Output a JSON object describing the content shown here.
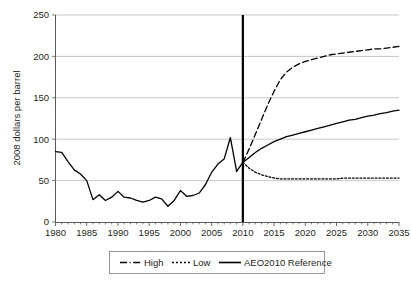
{
  "chart_data": {
    "type": "line",
    "title": "",
    "xlabel": "",
    "ylabel": "2008 dollars per barrel",
    "xlim": [
      1980,
      2035
    ],
    "ylim": [
      0,
      250
    ],
    "grid": true,
    "legend_position": "bottom",
    "y_ticks": [
      0,
      50,
      100,
      150,
      200,
      250
    ],
    "x_ticks": [
      1980,
      1985,
      1990,
      1995,
      2000,
      2005,
      2010,
      2015,
      2020,
      2025,
      2030,
      2035
    ],
    "x_tick_labels": [
      "1980",
      "1985",
      "1990",
      "1995",
      "2000",
      "2005",
      "2010",
      "2015",
      "2020",
      "2025",
      "2030",
      "2035"
    ],
    "y_tick_labels": [
      "0",
      "50",
      "100",
      "150",
      "200",
      "250"
    ],
    "x_minor_tick_interval": 1,
    "annotations": [
      {
        "name": "history-projection-divider",
        "type": "vertical-line",
        "x": 2010,
        "style": "solid-thick-black"
      }
    ],
    "series": [
      {
        "name": "History",
        "style": "solid",
        "color": "#000000",
        "x": [
          1980,
          1981,
          1982,
          1983,
          1984,
          1985,
          1986,
          1987,
          1988,
          1989,
          1990,
          1991,
          1992,
          1993,
          1994,
          1995,
          1996,
          1997,
          1998,
          1999,
          2000,
          2001,
          2002,
          2003,
          2004,
          2005,
          2006,
          2007,
          2008,
          2009,
          2010
        ],
        "values": [
          85,
          84,
          73,
          63,
          58,
          50,
          27,
          33,
          26,
          30,
          37,
          30,
          29,
          26,
          24,
          26,
          30,
          28,
          19,
          26,
          38,
          31,
          32,
          35,
          45,
          60,
          70,
          76,
          102,
          61,
          72
        ]
      },
      {
        "name": "High",
        "style": "dashed",
        "color": "#000000",
        "x": [
          2010,
          2011,
          2012,
          2013,
          2014,
          2015,
          2016,
          2017,
          2018,
          2019,
          2020,
          2021,
          2022,
          2023,
          2024,
          2025,
          2026,
          2027,
          2028,
          2029,
          2030,
          2031,
          2032,
          2033,
          2034,
          2035
        ],
        "values": [
          72,
          88,
          106,
          124,
          142,
          158,
          172,
          181,
          187,
          191,
          194,
          196,
          198,
          200,
          202,
          203,
          204,
          205,
          206,
          207,
          208,
          209,
          209,
          210,
          211,
          212
        ]
      },
      {
        "name": "Low",
        "style": "dotted",
        "color": "#000000",
        "x": [
          2010,
          2011,
          2012,
          2013,
          2014,
          2015,
          2016,
          2017,
          2018,
          2019,
          2020,
          2021,
          2022,
          2023,
          2024,
          2025,
          2026,
          2027,
          2028,
          2029,
          2030,
          2031,
          2032,
          2033,
          2034,
          2035
        ],
        "values": [
          72,
          65,
          60,
          57,
          55,
          53,
          52,
          52,
          52,
          52,
          52,
          52,
          52,
          52,
          52,
          52,
          53,
          53,
          53,
          53,
          53,
          53,
          53,
          53,
          53,
          53
        ]
      },
      {
        "name": "AEO2010 Reference",
        "style": "solid",
        "color": "#000000",
        "x": [
          2010,
          2011,
          2012,
          2013,
          2014,
          2015,
          2016,
          2017,
          2018,
          2019,
          2020,
          2021,
          2022,
          2023,
          2024,
          2025,
          2026,
          2027,
          2028,
          2029,
          2030,
          2031,
          2032,
          2033,
          2034,
          2035
        ],
        "values": [
          72,
          78,
          84,
          89,
          93,
          97,
          100,
          103,
          105,
          107,
          109,
          111,
          113,
          115,
          117,
          119,
          121,
          123,
          124,
          126,
          128,
          129,
          131,
          132,
          134,
          135
        ]
      }
    ],
    "legend": [
      {
        "label": "High",
        "style": "dash-dot",
        "color": "#000000"
      },
      {
        "label": "Low",
        "style": "dotted",
        "color": "#000000"
      },
      {
        "label": "AEO2010 Reference",
        "style": "solid",
        "color": "#000000"
      }
    ]
  },
  "colors": {
    "background": "#ffffff",
    "ink": "#231f20",
    "gridline": "#b9b9b9",
    "axis": "#5a5a5a",
    "series": "#000000",
    "legend_border": "#7d7d7d"
  }
}
